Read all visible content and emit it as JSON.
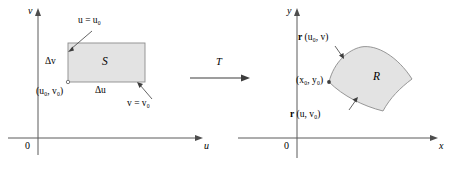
{
  "figure": {
    "background_color": "#ffffff",
    "stroke_color": "#4d4d4d",
    "fill_color": "#e3e3e3",
    "text_color": "#000000"
  },
  "uv_plane": {
    "name": "uv-plane",
    "vertical_axis_label": "v",
    "horizontal_axis_label": "u",
    "origin_label": "0",
    "region_label": "S",
    "corner_point_label": "(u₀, v₀)",
    "delta_v_label": "Δv",
    "delta_u_label": "Δu",
    "left_edge_label": "u = u₀",
    "bottom_edge_label": "v = v₀",
    "rect": {
      "x": 68,
      "y": 43,
      "width": 77,
      "height": 39
    }
  },
  "transform": {
    "label": "T",
    "arrow_direction": "right"
  },
  "xy_plane": {
    "name": "xy-plane",
    "vertical_axis_label": "y",
    "horizontal_axis_label": "x",
    "origin_label": "0",
    "region_label": "R",
    "corner_point_label": "(x₀, y₀)",
    "top_curve_label_vector": "r",
    "top_curve_label_args": "(u₀, v)",
    "bottom_curve_label_vector": "r",
    "bottom_curve_label_args": "(u, v₀)"
  }
}
